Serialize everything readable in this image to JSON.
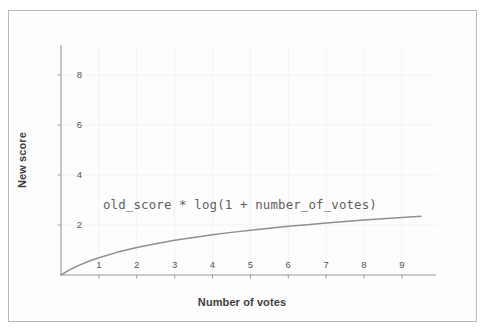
{
  "figure": {
    "background_color": "#fdfdfd",
    "border_color": "#b9b9b9"
  },
  "chart_data": {
    "type": "line",
    "title": "",
    "xlabel": "Number of votes",
    "ylabel": "New score",
    "xlim": [
      0,
      9.9
    ],
    "ylim": [
      0,
      9.2
    ],
    "xticks": [
      "1",
      "2",
      "3",
      "4",
      "5",
      "6",
      "7",
      "8",
      "9"
    ],
    "yticks": [
      "2",
      "4",
      "6",
      "8"
    ],
    "grid": true,
    "legend": "none",
    "annotations": [
      {
        "text": "old_score * log(1 + number_of_votes)",
        "x": 1.3,
        "y": 2.8
      }
    ],
    "series": [
      {
        "name": "old_score * log(1 + number_of_votes)",
        "color": "#8f8f8f",
        "formula": "log(1 + x)",
        "x": [
          0,
          0.1,
          0.2,
          0.3,
          0.5,
          0.75,
          1,
          1.5,
          2,
          2.5,
          3,
          3.5,
          4,
          4.5,
          5,
          5.5,
          6,
          6.5,
          7,
          7.5,
          8,
          8.5,
          9,
          9.5
        ],
        "values": [
          0,
          0.095,
          0.182,
          0.262,
          0.405,
          0.56,
          0.693,
          0.916,
          1.099,
          1.253,
          1.386,
          1.504,
          1.609,
          1.705,
          1.792,
          1.872,
          1.946,
          2.015,
          2.079,
          2.14,
          2.197,
          2.251,
          2.303,
          2.351
        ]
      }
    ]
  },
  "axes": {
    "spine_color": "#9a9a9a",
    "grid_color": "#f2f2f2",
    "tick_color": "#9a9a9a",
    "tick_label_color": "#555555"
  }
}
